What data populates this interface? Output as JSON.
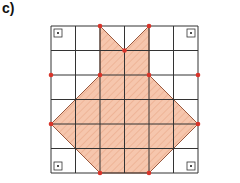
{
  "label": "c)",
  "grid": {
    "left": 51,
    "top": 26,
    "cell": 24.5,
    "cols": 6,
    "rows": 6,
    "line_color": "#333333"
  },
  "shape": {
    "fill": "#f6c6ad",
    "stroke": "#9a5a40",
    "vertices": [
      [
        2,
        0
      ],
      [
        3,
        1
      ],
      [
        4,
        0
      ],
      [
        4,
        2
      ],
      [
        6,
        4
      ],
      [
        4,
        6
      ],
      [
        2,
        6
      ],
      [
        0,
        4
      ],
      [
        2,
        2
      ]
    ]
  },
  "points": {
    "color": "#d9342a",
    "list": [
      [
        2,
        0
      ],
      [
        4,
        0
      ],
      [
        3,
        1
      ],
      [
        0,
        2
      ],
      [
        2,
        2
      ],
      [
        4,
        2
      ],
      [
        6,
        2
      ],
      [
        0,
        4
      ],
      [
        6,
        4
      ],
      [
        2,
        6
      ],
      [
        4,
        6
      ]
    ]
  },
  "right_angle_markers": [
    [
      0,
      0,
      "tl"
    ],
    [
      6,
      0,
      "tr"
    ],
    [
      0,
      6,
      "bl"
    ],
    [
      6,
      6,
      "br"
    ]
  ]
}
